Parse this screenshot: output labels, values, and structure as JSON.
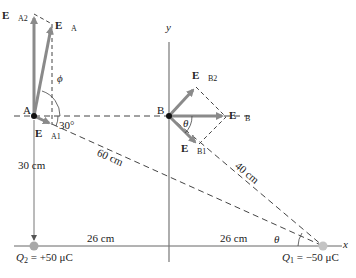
{
  "points": {
    "A": {
      "label": "A"
    },
    "B": {
      "label": "B"
    }
  },
  "charges": {
    "Q2": {
      "symbol": "Q",
      "sub": "2",
      "value": "= +50 μC"
    },
    "Q1": {
      "symbol": "Q",
      "sub": "1",
      "value": "= −50 μC"
    }
  },
  "vectors": {
    "EA2": {
      "main": "E",
      "sub": "A2"
    },
    "EA": {
      "main": "E",
      "sub": "A"
    },
    "EA1": {
      "main": "E",
      "sub": "A1"
    },
    "EB2": {
      "main": "E",
      "sub": "B2"
    },
    "EB": {
      "main": "E",
      "sub": "B"
    },
    "EB1": {
      "main": "E",
      "sub": "B1"
    }
  },
  "angles": {
    "phi": "ϕ",
    "thirty": "30°",
    "theta_B": "θ",
    "theta_Q1": "θ"
  },
  "distances": {
    "d60": "60 cm",
    "d40": "40 cm",
    "d30": "30 cm",
    "d26_left": "26 cm",
    "d26_right": "26 cm"
  },
  "axes": {
    "x": "x",
    "y": "y"
  },
  "colors": {
    "vector": "#8a8a8a",
    "line": "#555555",
    "charge": "#a8a8a8",
    "point": "#111111"
  }
}
